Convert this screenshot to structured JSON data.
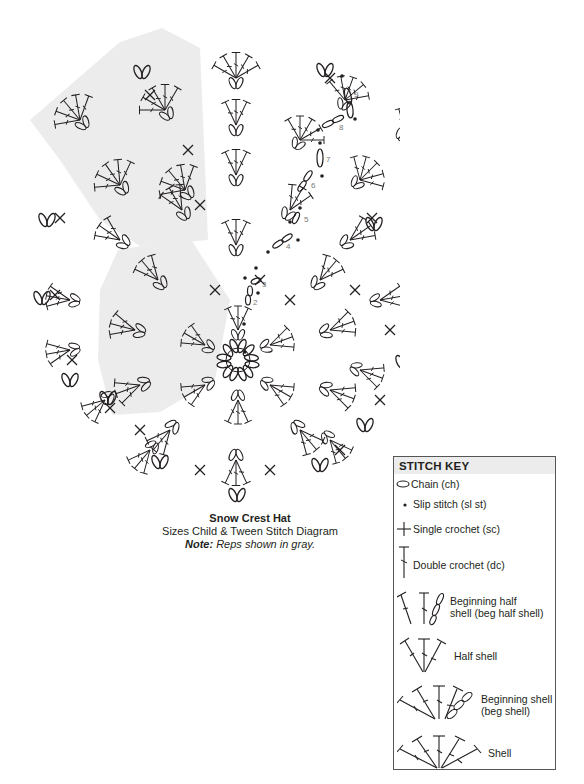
{
  "caption": {
    "title": "Snow Crest Hat",
    "subtitle": "Sizes Child & Tween Stitch Diagram",
    "note_label": "Note:",
    "note_text": "Reps shown in gray."
  },
  "round_numbers": [
    "2",
    "3",
    "4",
    "5",
    "6",
    "7",
    "8",
    "9"
  ],
  "colors": {
    "ink": "#231f20",
    "rep_gray": "#ececec",
    "number_gray": "#777777",
    "key_border": "#555555"
  },
  "stitch_key": {
    "title": "STITCH KEY",
    "items": [
      {
        "icon": "chain-icon",
        "label": "Chain (ch)"
      },
      {
        "icon": "slip-stitch-icon",
        "label": "Slip stitch (sl st)"
      },
      {
        "icon": "single-crochet-icon",
        "label": "Single crochet (sc)"
      },
      {
        "icon": "double-crochet-icon",
        "label": "Double crochet (dc)"
      },
      {
        "icon": "beginning-half-shell-icon",
        "label_line1": "Beginning half",
        "label_line2": "shell (beg half shell)"
      },
      {
        "icon": "half-shell-icon",
        "label": "Half shell"
      },
      {
        "icon": "beginning-shell-icon",
        "label_line1": "Beginning shell",
        "label_line2": "(beg shell)"
      },
      {
        "icon": "shell-icon",
        "label": "Shell"
      }
    ]
  }
}
